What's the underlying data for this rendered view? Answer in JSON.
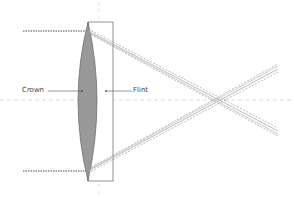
{
  "diagram": {
    "labels": {
      "crown": "Crown",
      "flint": "Flint"
    },
    "colors": {
      "crown_fill": "#999999",
      "crown_stroke": "#555555",
      "flint_stroke": "#777777",
      "axis": "#dddddd",
      "ray_solid": "#aaaaaa",
      "ray_dashed": "#888888",
      "incoming_ray": "#888888",
      "label_text": "#444444"
    }
  }
}
